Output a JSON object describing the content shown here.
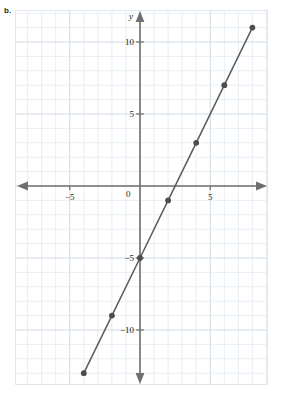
{
  "figure": {
    "part_label": "b.",
    "colors": {
      "grid_minor": "#e4ecf2",
      "grid_major": "#cfdbe4",
      "axis": "#6f6f6f",
      "line": "#5a5a5a",
      "marker": "#4d4d4d",
      "text": "#221f1f",
      "border": "#e0e6eb",
      "background": "#ffffff"
    }
  },
  "chart_data": {
    "type": "line",
    "title": "",
    "subtitle": "",
    "xlabel": "",
    "ylabel": "y",
    "axis_names": {
      "x": "",
      "y": "y"
    },
    "equation": "y = 2x - 5",
    "slope": 2,
    "y_intercept": -5,
    "xlim": [
      -7,
      9
    ],
    "ylim": [
      -14,
      12
    ],
    "grid": true,
    "grid_step": 1,
    "major_grid_step": 5,
    "legend": null,
    "legend_position": "none",
    "origin_label": "0",
    "x_ticks": [
      -5,
      5
    ],
    "x_tick_labels": [
      "−5",
      "5"
    ],
    "y_ticks": [
      -10,
      -5,
      5,
      10
    ],
    "y_tick_labels": [
      "−10",
      "−5",
      "5",
      "10"
    ],
    "series": [
      {
        "name": "y = 2x - 5",
        "x": [
          -4,
          -2,
          0,
          2,
          4,
          6,
          8
        ],
        "values": [
          -13,
          -9,
          -5,
          -1,
          3,
          7,
          11
        ],
        "points": [
          {
            "x": -4,
            "y": -13
          },
          {
            "x": -2,
            "y": -9
          },
          {
            "x": 0,
            "y": -5
          },
          {
            "x": 2,
            "y": -1
          },
          {
            "x": 4,
            "y": 3
          },
          {
            "x": 6,
            "y": 7
          },
          {
            "x": 8,
            "y": 11
          }
        ]
      }
    ],
    "annotations": []
  }
}
